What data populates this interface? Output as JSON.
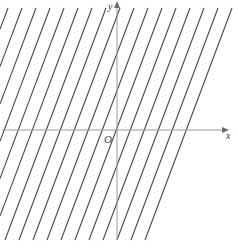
{
  "figure": {
    "kind": "coordinate-plane-with-parallel-lines",
    "background_color": "#ffffff",
    "width": 238,
    "height": 251
  },
  "axes": {
    "x_axis": {
      "label": "x",
      "color": "#9a9a9a",
      "stroke_width": 1,
      "y_pixel": 130,
      "x_start_pixel": 2,
      "x_end_pixel": 224,
      "arrow_end": "right"
    },
    "y_axis": {
      "label": "y",
      "color": "#9a9a9a",
      "stroke_width": 1,
      "x_pixel": 117,
      "y_start_pixel": 240,
      "y_end_pixel": 6,
      "arrow_end": "top"
    },
    "origin": {
      "label": "O",
      "x_pixel": 117,
      "y_pixel": 130
    }
  },
  "lines": {
    "description": "family of parallel lines with positive slope",
    "color": "#4d4d4d",
    "stroke_width": 1.1,
    "slope_dx_over_dy": 0.375,
    "horizontal_spacing_px": 14,
    "top_y_pixel": 8,
    "bottom_y_pixel": 240,
    "top_x_starts": [
      8,
      22,
      36,
      50,
      64,
      78,
      92,
      106,
      120,
      134,
      148,
      162,
      176,
      190,
      204,
      218,
      232
    ],
    "count": 17
  },
  "chart_data": {
    "type": "line",
    "title": "",
    "xlabel": "x",
    "ylabel": "y",
    "grid": false,
    "legend": null,
    "origin_label": "O",
    "slope": 2.67,
    "series": [
      {
        "name": "line-1",
        "intercept_b": 13.6
      },
      {
        "name": "line-2",
        "intercept_b": 11.6
      },
      {
        "name": "line-3",
        "intercept_b": 9.6
      },
      {
        "name": "line-4",
        "intercept_b": 7.6
      },
      {
        "name": "line-5",
        "intercept_b": 5.6
      },
      {
        "name": "line-6",
        "intercept_b": 3.6
      },
      {
        "name": "line-7",
        "intercept_b": 1.6
      },
      {
        "name": "line-8",
        "intercept_b": -0.4
      },
      {
        "name": "line-9",
        "intercept_b": -2.4
      },
      {
        "name": "line-10",
        "intercept_b": -4.4
      },
      {
        "name": "line-11",
        "intercept_b": -6.4
      },
      {
        "name": "line-12",
        "intercept_b": -8.4
      },
      {
        "name": "line-13",
        "intercept_b": -10.4
      },
      {
        "name": "line-14",
        "intercept_b": -12.4
      },
      {
        "name": "line-15",
        "intercept_b": -14.4
      },
      {
        "name": "line-16",
        "intercept_b": -16.4
      },
      {
        "name": "line-17",
        "intercept_b": -18.4
      }
    ]
  }
}
